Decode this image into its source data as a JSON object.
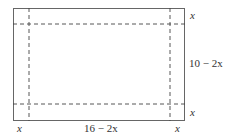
{
  "diagram": {
    "labels": {
      "top_right_x": "x",
      "right_side": "10 − 2x",
      "bottom_right_x": "x",
      "bottom_left_x": "x",
      "bottom_middle": "16 − 2x",
      "bottom_right_corner_x": "x"
    },
    "colors": {
      "stroke": "#555555",
      "dash": "#444444",
      "text": "#333333"
    }
  }
}
